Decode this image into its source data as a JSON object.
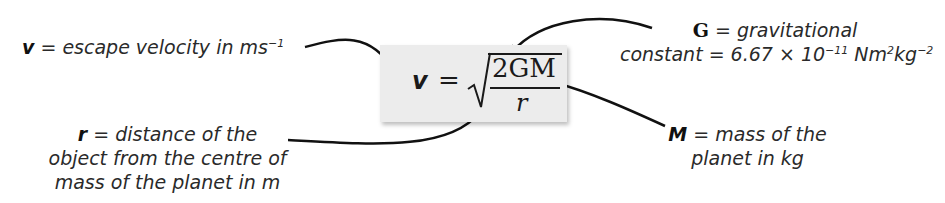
{
  "diagram": {
    "formula": {
      "lhs": "v",
      "equals": "=",
      "numerator": "2GM",
      "denominator": "r",
      "radical": "√"
    },
    "annotations": {
      "v": {
        "symbol": "v",
        "text": " = escape velocity in ms",
        "sup": "−1"
      },
      "G": {
        "symbol": "G",
        "line1": " = gravitational",
        "line2_pre": "constant = 6.67 × 10",
        "sup1": "−11",
        "line2_mid": " Nm",
        "sup2": "2",
        "line2_mid2": "kg",
        "sup3": "−2"
      },
      "r": {
        "symbol": "r",
        "line1": " = distance of the",
        "line2": "object from the centre of",
        "line3": "mass of the planet in m"
      },
      "M": {
        "symbol": "M",
        "line1": " = mass of the",
        "line2": "planet in kg"
      }
    },
    "colors": {
      "background": "#ffffff",
      "box": "#ececec",
      "text": "#2a2a2a",
      "arrow": "#111111"
    }
  }
}
